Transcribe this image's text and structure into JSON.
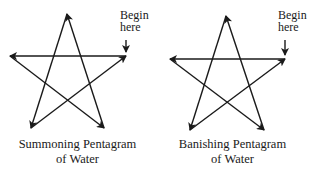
{
  "figures": [
    {
      "caption_line1": "Summoning Pentagram",
      "caption_line2": "of Water",
      "begin_label_line1": "Begin",
      "begin_label_line2": "here",
      "points": {
        "top": [
          67,
          14
        ],
        "right": [
          126,
          56
        ],
        "left": [
          10,
          56
        ],
        "bottom_left": [
          31,
          128
        ],
        "bottom_right": [
          104,
          128
        ]
      }
    },
    {
      "caption_line1": "Banishing Pentagram",
      "caption_line2": "of Water",
      "begin_label_line1": "Begin",
      "begin_label_line2": "here",
      "points": {
        "top": [
          71,
          16
        ],
        "right": [
          130,
          59
        ],
        "left": [
          15,
          59
        ],
        "bottom_left": [
          35,
          130
        ],
        "bottom_right": [
          109,
          130
        ]
      }
    }
  ],
  "colors": {
    "stroke": "#1a1a1a",
    "background": "#ffffff"
  }
}
